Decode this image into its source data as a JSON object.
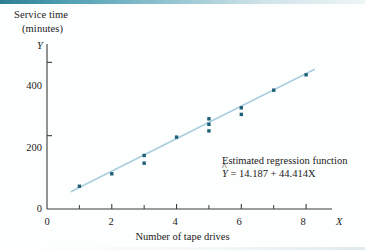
{
  "figure": {
    "y_axis_title_line1": "Service time",
    "y_axis_title_line2": "(minutes)",
    "y_axis_symbol": "Y",
    "x_axis_symbol": "X",
    "x_axis_title": "Number of tape drives",
    "annotation_label": "Estimated regression function",
    "annotation_equation_lead": "Y",
    "annotation_equation_rest": " = 14.187 + 44.414X",
    "line_color": "#a9cfdd",
    "point_color": "#1f5f78",
    "axis_color": "#3a3a3a",
    "top_rule_color": "#2e7f95"
  },
  "chart_data": {
    "type": "scatter",
    "title": "",
    "xlabel": "Number of tape drives",
    "ylabel": "Service time (minutes)",
    "xlim": [
      0,
      8.8
    ],
    "ylim": [
      0,
      450
    ],
    "grid": false,
    "legend": false,
    "x_ticks_major": [
      0,
      2,
      4,
      6,
      8
    ],
    "x_ticks_minor": [
      1,
      3,
      5,
      7
    ],
    "x_tick_labels": [
      "0",
      "2",
      "4",
      "6",
      "8"
    ],
    "y_ticks_major": [
      0,
      200,
      400
    ],
    "y_tick_labels": [
      "0",
      "200",
      "400"
    ],
    "points": [
      {
        "x": 1,
        "y": 62
      },
      {
        "x": 2,
        "y": 96
      },
      {
        "x": 3,
        "y": 125
      },
      {
        "x": 3,
        "y": 146
      },
      {
        "x": 4,
        "y": 196
      },
      {
        "x": 5,
        "y": 213
      },
      {
        "x": 5,
        "y": 231
      },
      {
        "x": 5,
        "y": 246
      },
      {
        "x": 6,
        "y": 258
      },
      {
        "x": 6,
        "y": 276
      },
      {
        "x": 7,
        "y": 324
      },
      {
        "x": 8,
        "y": 366
      }
    ],
    "fit_line": {
      "label": "Estimated regression function",
      "equation": "Y-hat = 14.187 + 44.414X",
      "intercept": 14.187,
      "slope": 44.414,
      "x_start": 0.75,
      "x_end": 8.25
    },
    "annotations": [
      {
        "text_line1": "Estimated regression function",
        "text_line2": "Y-hat = 14.187 + 44.414X",
        "arrow_from_x": 5.35,
        "arrow_from_y": 150,
        "arrow_to_x": 4.62,
        "arrow_to_y": 222
      }
    ]
  }
}
